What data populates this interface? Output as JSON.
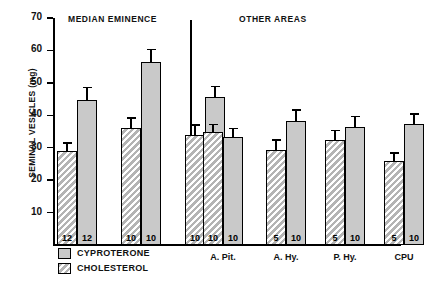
{
  "chart_data": {
    "type": "bar",
    "title": "",
    "xlabel": "",
    "ylabel": "SEMINAL VESICLES (mg)",
    "ylim": [
      0,
      70
    ],
    "yticks": [
      10,
      20,
      30,
      40,
      50,
      60,
      70
    ],
    "grid": false,
    "legend_position": "bottom-left",
    "panels": [
      {
        "name": "MEDIAN EMINENCE",
        "groups": [
          {
            "label": "",
            "bars": [
              {
                "series": "CHOLESTEROL",
                "value": 29.0,
                "error": 2.2,
                "n": "12"
              },
              {
                "series": "CYPROTERONE",
                "value": 44.8,
                "error": 3.6,
                "n": "12"
              }
            ]
          },
          {
            "label": "",
            "bars": [
              {
                "series": "CHOLESTEROL",
                "value": 36.0,
                "error": 3.0,
                "n": "10"
              },
              {
                "series": "CYPROTERONE",
                "value": 56.5,
                "error": 3.6,
                "n": "10"
              }
            ]
          },
          {
            "label": "",
            "bars": [
              {
                "series": "CHOLESTEROL",
                "value": 34.0,
                "error": 2.8,
                "n": "10"
              },
              {
                "series": "CYPROTERONE",
                "value": 45.5,
                "error": 3.2,
                "n": "10"
              }
            ]
          }
        ]
      },
      {
        "name": "OTHER AREAS",
        "groups": [
          {
            "label": "A. Pit.",
            "bars": [
              {
                "series": "CHOLESTEROL",
                "value": 34.8,
                "error": 2.2,
                "n": "10"
              },
              {
                "series": "CYPROTERONE",
                "value": 33.3,
                "error": 2.4,
                "n": "10"
              }
            ]
          },
          {
            "label": "A. Hy.",
            "bars": [
              {
                "series": "CHOLESTEROL",
                "value": 29.4,
                "error": 2.8,
                "n": "5"
              },
              {
                "series": "CYPROTERONE",
                "value": 38.2,
                "error": 3.2,
                "n": "10"
              }
            ]
          },
          {
            "label": "P. Hy.",
            "bars": [
              {
                "series": "CHOLESTEROL",
                "value": 32.3,
                "error": 2.8,
                "n": "5"
              },
              {
                "series": "CYPROTERONE",
                "value": 36.5,
                "error": 3.0,
                "n": "10"
              }
            ]
          },
          {
            "label": "CPU",
            "bars": [
              {
                "series": "CHOLESTEROL",
                "value": 26.0,
                "error": 2.2,
                "n": "5"
              },
              {
                "series": "CYPROTERONE",
                "value": 37.2,
                "error": 3.0,
                "n": "10"
              }
            ]
          }
        ]
      }
    ],
    "legend": [
      {
        "label": "CYPROTERONE",
        "pattern": "solid",
        "color": "#c9c9c9"
      },
      {
        "label": "CHOLESTEROL",
        "pattern": "hatch",
        "color": "#b4b4b4"
      }
    ]
  },
  "headers": {
    "median_eminence": "MEDIAN EMINENCE",
    "other_areas": "OTHER AREAS"
  },
  "axis": {
    "y_title": "SEMINAL VESICLES (mg)",
    "y_tick_labels": [
      "70",
      "60",
      "50",
      "40",
      "30",
      "20",
      "10"
    ]
  },
  "legend": {
    "cyproterone": "CYPROTERONE",
    "cholesterol": "CHOLESTEROL"
  }
}
